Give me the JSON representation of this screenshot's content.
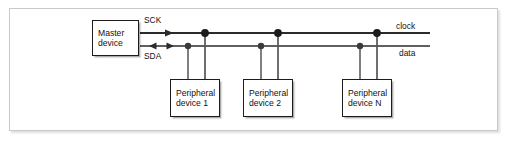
{
  "figure": {
    "type": "block-diagram",
    "background_color": "#ffffff",
    "frame_border_color": "#c9c9c9",
    "line_color": "#2b2b2b",
    "box_border_color": "#1c1c1c",
    "text_color": "#121212"
  },
  "blocks": {
    "master": {
      "name": "master-device",
      "line1": "Master",
      "line2": "device"
    },
    "peripherals": [
      {
        "name": "peripheral-device-1",
        "line1": "Peripheral",
        "line2": "device 1"
      },
      {
        "name": "peripheral-device-2",
        "line1": "Peripheral",
        "line2": "device 2"
      },
      {
        "name": "peripheral-device-n",
        "line1": "Peripheral",
        "line2": "device N"
      }
    ]
  },
  "signals": {
    "sck_label": "SCK",
    "sda_label": "SDA",
    "clock_label": "clock",
    "data_label": "data"
  },
  "buses": [
    {
      "name": "clock-bus",
      "left_label": "SCK",
      "right_label": "clock",
      "direction": "unidirectional",
      "arrow": "right",
      "y": 33,
      "junction_count": 3
    },
    {
      "name": "data-bus",
      "left_label": "SDA",
      "right_label": "data",
      "direction": "bidirectional",
      "arrow": "both",
      "y": 46,
      "junction_count": 3
    }
  ]
}
